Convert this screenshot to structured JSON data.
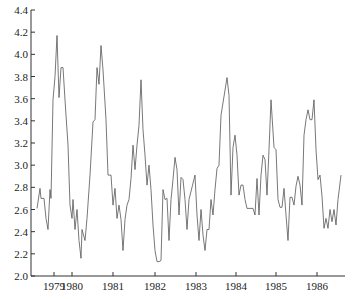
{
  "chart_data": {
    "type": "line",
    "title": "",
    "xlabel": "",
    "ylabel": "",
    "ylim": [
      2.0,
      4.4
    ],
    "grid": false,
    "legend": null,
    "y_ticks": [
      "2.0",
      "2.2",
      "2.4",
      "2.6",
      "2.8",
      "3.0",
      "3.2",
      "3.4",
      "3.6",
      "3.8",
      "4.0",
      "4.2",
      "4.4"
    ],
    "x_ticks": [
      {
        "label": "1979",
        "px": 54
      },
      {
        "label": "1980",
        "px": 72
      },
      {
        "label": "1981",
        "px": 113
      },
      {
        "label": "1982",
        "px": 155
      },
      {
        "label": "1983",
        "px": 196
      },
      {
        "label": "1984",
        "px": 236
      },
      {
        "label": "1985",
        "px": 276
      },
      {
        "label": "1986",
        "px": 317
      }
    ],
    "series": [
      {
        "name": "series",
        "color": "#555555",
        "x_px": [
          37,
          40,
          41,
          44,
          46,
          48,
          50,
          51,
          53,
          55,
          57,
          59,
          61,
          63,
          65,
          66,
          68,
          70,
          72,
          73,
          75,
          77,
          79,
          81,
          82,
          85,
          87,
          90,
          93,
          95,
          97,
          99,
          101,
          103,
          106,
          108,
          111,
          113,
          115,
          117,
          119,
          121,
          123,
          125,
          127,
          129,
          131,
          133,
          135,
          137,
          139,
          141,
          143,
          145,
          147,
          149,
          151,
          153,
          155,
          157,
          159,
          161,
          163,
          165,
          167,
          169,
          171,
          173,
          175,
          177,
          179,
          181,
          183,
          185,
          187,
          189,
          195,
          197,
          199,
          201,
          203,
          205,
          207,
          209,
          211,
          213,
          215,
          217,
          219,
          221,
          227,
          229,
          231,
          233,
          235,
          237,
          239,
          241,
          243,
          245,
          247,
          251,
          253,
          255,
          257,
          259,
          261,
          263,
          265,
          267,
          269,
          271,
          274,
          276,
          278,
          280,
          282,
          284,
          286,
          288,
          290,
          292,
          294,
          296,
          298,
          300,
          302,
          304,
          306,
          308,
          310,
          312,
          314,
          316,
          318,
          320,
          322,
          324,
          326,
          328,
          330,
          332,
          334,
          336,
          338,
          341
        ],
        "values": [
          2.61,
          2.79,
          2.7,
          2.7,
          2.52,
          2.42,
          2.78,
          2.7,
          3.59,
          3.8,
          4.17,
          3.61,
          3.88,
          3.88,
          3.59,
          3.45,
          3.18,
          2.64,
          2.52,
          2.69,
          2.42,
          2.6,
          2.32,
          2.16,
          2.42,
          2.32,
          2.52,
          2.91,
          3.39,
          3.41,
          3.88,
          3.73,
          4.08,
          3.86,
          3.41,
          2.91,
          2.91,
          2.64,
          2.79,
          2.52,
          2.64,
          2.51,
          2.23,
          2.51,
          2.64,
          2.69,
          2.88,
          3.18,
          2.96,
          3.18,
          3.36,
          3.77,
          3.32,
          3.09,
          2.82,
          3.0,
          2.78,
          2.46,
          2.23,
          2.13,
          2.13,
          2.14,
          2.78,
          2.69,
          2.7,
          2.32,
          2.69,
          2.87,
          3.07,
          2.96,
          2.55,
          2.89,
          2.87,
          2.69,
          2.42,
          2.69,
          2.91,
          2.55,
          2.32,
          2.6,
          2.37,
          2.23,
          2.42,
          2.42,
          2.69,
          2.55,
          2.78,
          2.97,
          3.0,
          3.45,
          3.79,
          3.63,
          2.73,
          3.16,
          3.27,
          3.09,
          2.73,
          2.82,
          2.82,
          2.69,
          2.61,
          2.61,
          2.61,
          2.55,
          2.88,
          2.55,
          2.91,
          3.09,
          3.05,
          2.73,
          3.14,
          3.59,
          3.16,
          3.14,
          2.69,
          2.62,
          2.62,
          2.79,
          2.55,
          2.32,
          2.71,
          2.71,
          2.64,
          2.81,
          2.9,
          2.82,
          2.64,
          3.27,
          3.41,
          3.5,
          3.41,
          3.41,
          3.59,
          3.14,
          2.87,
          2.91,
          2.72,
          2.43,
          2.52,
          2.43,
          2.6,
          2.49,
          2.6,
          2.46,
          2.69,
          2.91
        ]
      }
    ],
    "layout": {
      "axis_x_px": 31,
      "axis_y_bottom_px": 276,
      "axis_y_top_px": 10,
      "axis_x_right_px": 345
    }
  },
  "caption_clipped": "..."
}
